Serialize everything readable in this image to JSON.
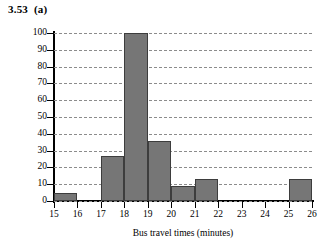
{
  "figure": {
    "label": "3.53  (a)"
  },
  "chart_data": {
    "type": "bar",
    "title": "",
    "xlabel": "Bus travel times (minutes)",
    "ylabel": "Frequency",
    "xlim": [
      15,
      26
    ],
    "ylim": [
      0,
      100
    ],
    "xticks": [
      15,
      16,
      17,
      18,
      19,
      20,
      21,
      22,
      23,
      24,
      25,
      26
    ],
    "yticks": [
      0,
      10,
      20,
      30,
      40,
      50,
      60,
      70,
      80,
      90,
      100
    ],
    "grid": "horizontal-dashed",
    "legend": "none",
    "bin_width": 1,
    "bin_starts": [
      15,
      16,
      17,
      18,
      19,
      20,
      21,
      22,
      23,
      24,
      25
    ],
    "bin_labels": [
      "15-16",
      "16-17",
      "17-18",
      "18-19",
      "19-20",
      "20-21",
      "21-22",
      "22-23",
      "23-24",
      "24-25",
      "25-26"
    ],
    "values": [
      5,
      0,
      27,
      100,
      36,
      9,
      13,
      0,
      0,
      0,
      13
    ],
    "bar_color": "#767676",
    "bar_edge_color": "#3d3d3d",
    "grid_color": "#8c8c8c",
    "axis_color": "#000000"
  }
}
